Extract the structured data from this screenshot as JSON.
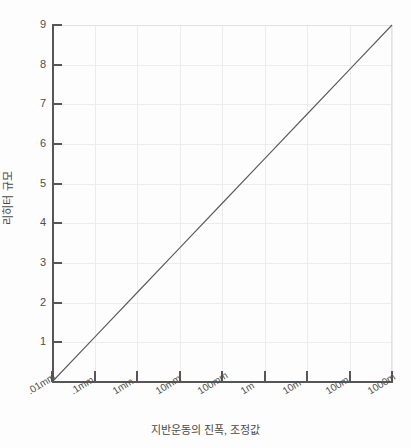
{
  "chart_data": {
    "type": "line",
    "title": "",
    "xlabel": "지반운동의 진폭, 조정값",
    "ylabel": "리히터 규모",
    "x_scale": "log",
    "y_scale": "linear",
    "grid": true,
    "legend": "none",
    "x_tick_labels": [
      ".01mm",
      ".1mm",
      "1mm",
      "10mm",
      "100mm",
      "1m",
      "10m",
      "100m",
      "1000m"
    ],
    "x_tick_values": [
      0.01,
      0.1,
      1,
      10,
      100,
      1000,
      10000,
      100000,
      1000000
    ],
    "y_tick_labels": [
      "1",
      "2",
      "3",
      "4",
      "5",
      "6",
      "7",
      "8",
      "9"
    ],
    "y_tick_values": [
      1,
      2,
      3,
      4,
      5,
      6,
      7,
      8,
      9
    ],
    "ylim": [
      0,
      9
    ],
    "xlim_labels": [
      ".01mm",
      "1000m"
    ],
    "series": [
      {
        "name": "리히터 규모",
        "x": [
          0.01,
          0.1,
          1,
          10,
          100,
          1000,
          10000,
          100000,
          1000000
        ],
        "values": [
          0.0,
          1.125,
          2.25,
          3.375,
          4.5,
          5.625,
          6.75,
          7.875,
          9.0
        ],
        "color": "#595959"
      }
    ],
    "annotations": []
  },
  "colors": {
    "background": "#fdfdfd",
    "axis": "#565656",
    "grid": "#ececec",
    "line": "#595959",
    "text": "#4a4a4a"
  }
}
